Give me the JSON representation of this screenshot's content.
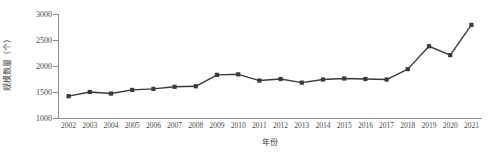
{
  "chart_data": {
    "type": "line",
    "title": "",
    "xlabel": "年份",
    "ylabel": "规模数量（个）",
    "categories": [
      "2002",
      "2003",
      "2004",
      "2005",
      "2006",
      "2007",
      "2008",
      "2009",
      "2010",
      "2011",
      "2012",
      "2013",
      "2014",
      "2015",
      "2016",
      "2017",
      "2018",
      "2019",
      "2020",
      "2021"
    ],
    "values": [
      1420,
      1500,
      1470,
      1540,
      1560,
      1600,
      1610,
      1830,
      1840,
      1720,
      1750,
      1680,
      1740,
      1760,
      1750,
      1740,
      1940,
      2380,
      2210,
      2790
    ],
    "ylim": [
      1000,
      3000
    ],
    "yticks": [
      1000,
      1500,
      2000,
      2500,
      3000
    ],
    "ytick_labels": [
      "1000",
      "1500",
      "2000",
      "2500",
      "3000"
    ],
    "grid": false,
    "legend": "none",
    "series": [
      {
        "name": "规模数量",
        "marker": "square",
        "color": "#3a3a3a",
        "values": [
          1420,
          1500,
          1470,
          1540,
          1560,
          1600,
          1610,
          1830,
          1840,
          1720,
          1750,
          1680,
          1740,
          1760,
          1750,
          1740,
          1940,
          2380,
          2210,
          2790
        ]
      }
    ]
  },
  "colors": {
    "line": "#3a3a3a",
    "marker": "#3a3a3a",
    "axis": "#8c8c8c",
    "text": "#4a4a4a",
    "background": "#ffffff"
  }
}
